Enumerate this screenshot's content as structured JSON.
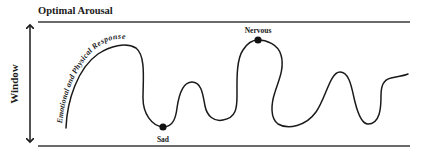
{
  "diagram": {
    "title": "Optimal Arousal",
    "axis_label": "Window",
    "curve_label": "Emotional and Physical Response",
    "points": [
      {
        "label": "Sad",
        "x": 163,
        "y": 127
      },
      {
        "label": "Nervous",
        "x": 258,
        "y": 40
      }
    ],
    "colors": {
      "line": "#2a2a2a",
      "text": "#1a1a1a",
      "background": "#ffffff"
    }
  }
}
